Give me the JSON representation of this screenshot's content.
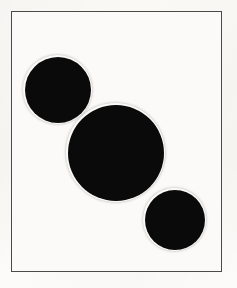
{
  "figure": {
    "canvas": {
      "width_px": 237,
      "height_px": 288,
      "background_color": "#faf9f6"
    },
    "frame": {
      "label": "rectangular border frame",
      "left_px": 11,
      "top_px": 11,
      "width_px": 211,
      "height_px": 261,
      "stroke_color": "#4a4a4a",
      "stroke_width_px": 1.5,
      "fill_color": "#fbfaf8"
    },
    "shapes": [
      {
        "name": "circle-top-left",
        "order": 1,
        "position_label": "upper left",
        "center_x_px": 58,
        "center_y_px": 90,
        "radius_px": 33,
        "diameter_px": 67,
        "fill_color": "#0a0a0a",
        "size_rank": "medium"
      },
      {
        "name": "circle-center",
        "order": 2,
        "position_label": "center",
        "center_x_px": 116,
        "center_y_px": 153,
        "radius_px": 48,
        "diameter_px": 96,
        "fill_color": "#0a0a0a",
        "size_rank": "largest"
      },
      {
        "name": "circle-bottom-right",
        "order": 3,
        "position_label": "lower right",
        "center_x_px": 175,
        "center_y_px": 220,
        "radius_px": 30,
        "diameter_px": 59,
        "fill_color": "#0a0a0a",
        "size_rank": "smallest"
      }
    ],
    "shape_count": 3,
    "palette": {
      "ink": "#0a0a0a",
      "frame_line": "#4a4a4a",
      "paper": "#faf9f6",
      "paper_inner": "#fbfaf8"
    }
  }
}
